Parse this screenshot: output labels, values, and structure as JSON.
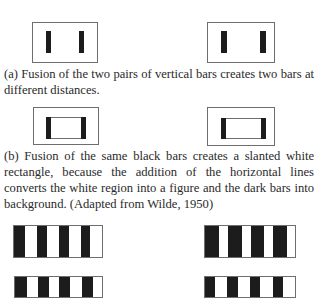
{
  "figure": {
    "part_a": {
      "caption": "(a) Fusion of the two pairs of vertical bars creates two bars at different distances.",
      "left_panel": {
        "box": [
          32,
          22,
          66,
          41
        ],
        "bars": [
          [
            46,
            31,
            5,
            22
          ],
          [
            79,
            31,
            5,
            22
          ]
        ]
      },
      "right_panel": {
        "box": [
          207,
          22,
          68,
          41
        ],
        "bars": [
          [
            221,
            31,
            6,
            22
          ],
          [
            260,
            31,
            6,
            22
          ]
        ]
      }
    },
    "part_b": {
      "caption": "(b) Fusion of the same black bars creates a slanted white rectangle, because the addition of the horizontal lines converts the white region into a figure and the dark bars into background. (Adapted from Wilde, 1950)",
      "left_panel": {
        "box": [
          33,
          107,
          66,
          38
        ],
        "inner": [
          46,
          117,
          40,
          22
        ],
        "bars": [
          [
            46,
            117,
            5,
            22
          ],
          [
            81,
            117,
            5,
            22
          ]
        ]
      },
      "right_panel": {
        "box": [
          207,
          107,
          68,
          39
        ],
        "inner": [
          221,
          118,
          45,
          21
        ],
        "bars": [
          [
            221,
            118,
            5,
            21
          ],
          [
            261,
            118,
            5,
            21
          ]
        ]
      }
    },
    "part_c": {
      "left_top": {
        "box": [
          13,
          225,
          90,
          33
        ],
        "bars": [
          [
            0,
            11
          ],
          [
            23,
            10
          ],
          [
            45,
            10
          ],
          [
            67,
            9
          ]
        ]
      },
      "right_top": {
        "box": [
          204,
          225,
          92,
          33
        ],
        "bars": [
          [
            0,
            14
          ],
          [
            23,
            14
          ],
          [
            46,
            13
          ],
          [
            68,
            14
          ]
        ]
      },
      "left_bottom": {
        "box": [
          14,
          276,
          89,
          22
        ],
        "bars": [
          [
            0,
            12
          ],
          [
            23,
            11
          ],
          [
            44,
            11
          ],
          [
            67,
            11
          ]
        ]
      },
      "right_bottom": {
        "box": [
          204,
          276,
          92,
          22
        ],
        "bars": [
          [
            0,
            10
          ],
          [
            22,
            11
          ],
          [
            45,
            10
          ],
          [
            68,
            10
          ]
        ]
      }
    }
  }
}
